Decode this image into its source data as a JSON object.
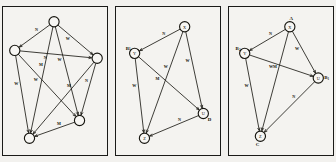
{
  "figure": {
    "type": "directed-graph-triptych",
    "panel_count": 3,
    "background_color": "#f2f1ee",
    "ink_color": "#16150f",
    "node_shape": "circle",
    "edge_style": "straight-arrow"
  },
  "panels": [
    {
      "id": "panel-1",
      "name": "complete-digraph",
      "nodes": [
        {
          "id": "n1",
          "label": "",
          "external_label": "",
          "x": 52,
          "y": 15
        },
        {
          "id": "n2",
          "label": "",
          "external_label": "",
          "x": 12,
          "y": 44
        },
        {
          "id": "n3",
          "label": "",
          "external_label": "",
          "x": 96,
          "y": 52
        },
        {
          "id": "n4",
          "label": "",
          "external_label": "",
          "x": 27,
          "y": 133
        },
        {
          "id": "n5",
          "label": "",
          "external_label": "",
          "x": 78,
          "y": 115
        }
      ],
      "edges": [
        {
          "from": "n1",
          "to": "n2",
          "label": "N"
        },
        {
          "from": "n1",
          "to": "n3",
          "label": "W"
        },
        {
          "from": "n1",
          "to": "n4",
          "label": "M"
        },
        {
          "from": "n1",
          "to": "n5",
          "label": "W"
        },
        {
          "from": "n2",
          "to": "n3",
          "label": "N"
        },
        {
          "from": "n2",
          "to": "n4",
          "label": "W"
        },
        {
          "from": "n2",
          "to": "n5",
          "label": "W"
        },
        {
          "from": "n3",
          "to": "n4",
          "label": "M"
        },
        {
          "from": "n3",
          "to": "n5",
          "label": "N"
        },
        {
          "from": "n5",
          "to": "n4",
          "label": "M"
        }
      ]
    },
    {
      "id": "panel-2",
      "name": "subgraph-xyzu",
      "nodes": [
        {
          "id": "n1",
          "label": "X",
          "external_label": "",
          "x": 70,
          "y": 20
        },
        {
          "id": "n2",
          "label": "Y",
          "external_label": "B",
          "external_sub": "1",
          "x": 19,
          "y": 47
        },
        {
          "id": "n3",
          "label": "U",
          "external_label": "D",
          "x": 89,
          "y": 108
        },
        {
          "id": "n4",
          "label": "Z",
          "external_label": "",
          "x": 29,
          "y": 133
        },
        {
          "id": "n5",
          "label": "",
          "external_label": "",
          "x": 0,
          "y": 0
        }
      ],
      "edges": [
        {
          "from": "n1",
          "to": "n2",
          "label": "N"
        },
        {
          "from": "n1",
          "to": "n3",
          "label": "W"
        },
        {
          "from": "n1",
          "to": "n4",
          "label": "W"
        },
        {
          "from": "n2",
          "to": "n3",
          "label": "M"
        },
        {
          "from": "n2",
          "to": "n4",
          "label": "W"
        },
        {
          "from": "n3",
          "to": "n4",
          "label": "N"
        }
      ]
    },
    {
      "id": "panel-3",
      "name": "subgraph-abc",
      "nodes": [
        {
          "id": "n1",
          "label": "X",
          "external_label": "A",
          "x": 62,
          "y": 20
        },
        {
          "id": "n2",
          "label": "Y",
          "external_label": "B",
          "external_sub": "2",
          "x": 16,
          "y": 47
        },
        {
          "id": "n3",
          "label": "U",
          "external_label": "B",
          "external_sub": "1",
          "x": 91,
          "y": 72
        },
        {
          "id": "n4",
          "label": "Z",
          "external_label": "C",
          "x": 32,
          "y": 131
        },
        {
          "id": "n5",
          "label": "",
          "external_label": "",
          "x": 0,
          "y": 0
        }
      ],
      "edges": [
        {
          "from": "n1",
          "to": "n2",
          "label": "N"
        },
        {
          "from": "n1",
          "to": "n3",
          "label": "W"
        },
        {
          "from": "n1",
          "to": "n4",
          "label": "M"
        },
        {
          "from": "n2",
          "to": "n3",
          "label": "W"
        },
        {
          "from": "n2",
          "to": "n4",
          "label": "W"
        },
        {
          "from": "n3",
          "to": "n4",
          "label": "N"
        }
      ]
    }
  ]
}
